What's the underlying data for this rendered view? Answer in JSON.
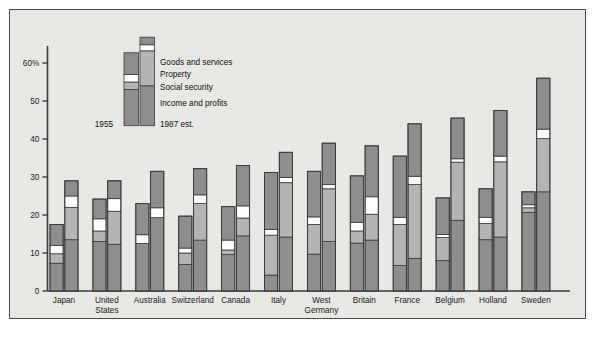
{
  "chart_data": {
    "type": "bar",
    "subtype": "grouped-stacked",
    "title": "",
    "xlabel": "",
    "ylabel": "",
    "ylim": [
      0,
      65
    ],
    "ytick_values": [
      0,
      10,
      20,
      30,
      40,
      50,
      60
    ],
    "ytick_labels": [
      "0",
      "10",
      "20",
      "30",
      "40",
      "50",
      "60%"
    ],
    "grid": false,
    "legend_position": "inside-upper-left",
    "series_order": [
      "Income and profits",
      "Social security",
      "Property",
      "Goods and services"
    ],
    "series_colors": [
      "#8e8e8e",
      "#b4b4b4",
      "#ffffff",
      "#8e8e8e"
    ],
    "group_labels": [
      "1955",
      "1987 est."
    ],
    "categories": [
      "Japan",
      "United States",
      "Australia",
      "Switzerland",
      "Canada",
      "Italy",
      "West Germany",
      "Britain",
      "France",
      "Belgium",
      "Holland",
      "Sweden"
    ],
    "category_label_lines": [
      [
        "Japan"
      ],
      [
        "United",
        "States"
      ],
      [
        "Australia"
      ],
      [
        "Switzerland"
      ],
      [
        "Canada"
      ],
      [
        "Italy"
      ],
      [
        "West",
        "Germany"
      ],
      [
        "Britain"
      ],
      [
        "France"
      ],
      [
        "Belgium"
      ],
      [
        "Holland"
      ],
      [
        "Sweden"
      ]
    ],
    "data": [
      {
        "category": "Japan",
        "1955": {
          "income_and_profits": 7.3,
          "social_security": 2.5,
          "property": 2.2,
          "goods_and_services": 5.5,
          "total": 17.5
        },
        "1987": {
          "income_and_profits": 13.5,
          "social_security": 8.5,
          "property": 3.0,
          "goods_and_services": 4.0,
          "total": 29.0
        }
      },
      {
        "category": "United States",
        "1955": {
          "income_and_profits": 13.0,
          "social_security": 2.8,
          "property": 3.2,
          "goods_and_services": 5.2,
          "total": 24.2
        },
        "1987": {
          "income_and_profits": 12.3,
          "social_security": 8.7,
          "property": 3.3,
          "goods_and_services": 4.7,
          "total": 29.0
        }
      },
      {
        "category": "Australia",
        "1955": {
          "income_and_profits": 12.5,
          "social_security": 0.0,
          "property": 2.3,
          "goods_and_services": 8.2,
          "total": 23.0
        },
        "1987": {
          "income_and_profits": 19.3,
          "social_security": 0.0,
          "property": 2.6,
          "goods_and_services": 9.6,
          "total": 31.5
        }
      },
      {
        "category": "Switzerland",
        "1955": {
          "income_and_profits": 7.0,
          "social_security": 3.0,
          "property": 1.3,
          "goods_and_services": 8.4,
          "total": 19.7
        },
        "1987": {
          "income_and_profits": 13.4,
          "social_security": 9.6,
          "property": 2.3,
          "goods_and_services": 6.9,
          "total": 32.2
        }
      },
      {
        "category": "Canada",
        "1955": {
          "income_and_profits": 9.6,
          "social_security": 1.2,
          "property": 2.6,
          "goods_and_services": 8.8,
          "total": 22.2
        },
        "1987": {
          "income_and_profits": 14.5,
          "social_security": 4.7,
          "property": 3.2,
          "goods_and_services": 10.6,
          "total": 33.0
        }
      },
      {
        "category": "Italy",
        "1955": {
          "income_and_profits": 4.2,
          "social_security": 10.5,
          "property": 1.5,
          "goods_and_services": 15.0,
          "total": 31.2
        },
        "1987": {
          "income_and_profits": 14.2,
          "social_security": 14.3,
          "property": 1.4,
          "goods_and_services": 6.6,
          "total": 36.5
        }
      },
      {
        "category": "West Germany",
        "1955": {
          "income_and_profits": 9.7,
          "social_security": 7.8,
          "property": 2.0,
          "goods_and_services": 12.0,
          "total": 31.5
        },
        "1987": {
          "income_and_profits": 13.0,
          "social_security": 13.9,
          "property": 1.1,
          "goods_and_services": 10.9,
          "total": 38.9
        }
      },
      {
        "category": "Britain",
        "1955": {
          "income_and_profits": 12.6,
          "social_security": 3.2,
          "property": 2.3,
          "goods_and_services": 12.2,
          "total": 30.3
        },
        "1987": {
          "income_and_profits": 13.4,
          "social_security": 6.8,
          "property": 4.6,
          "goods_and_services": 13.4,
          "total": 38.2
        }
      },
      {
        "category": "France",
        "1955": {
          "income_and_profits": 6.7,
          "social_security": 10.8,
          "property": 1.9,
          "goods_and_services": 16.1,
          "total": 35.5
        },
        "1987": {
          "income_and_profits": 8.6,
          "social_security": 19.4,
          "property": 2.2,
          "goods_and_services": 13.8,
          "total": 44.0
        }
      },
      {
        "category": "Belgium",
        "1955": {
          "income_and_profits": 8.0,
          "social_security": 6.1,
          "property": 0.8,
          "goods_and_services": 9.6,
          "total": 24.5
        },
        "1987": {
          "income_and_profits": 18.6,
          "social_security": 15.3,
          "property": 0.9,
          "goods_and_services": 10.7,
          "total": 45.5
        }
      },
      {
        "category": "Holland",
        "1955": {
          "income_and_profits": 13.5,
          "social_security": 4.3,
          "property": 1.6,
          "goods_and_services": 7.5,
          "total": 26.9
        },
        "1987": {
          "income_and_profits": 14.2,
          "social_security": 19.8,
          "property": 1.5,
          "goods_and_services": 12.0,
          "total": 47.5
        }
      },
      {
        "category": "Sweden",
        "1955": {
          "income_and_profits": 20.7,
          "social_security": 1.2,
          "property": 0.8,
          "goods_and_services": 3.4,
          "total": 26.1
        },
        "1987": {
          "income_and_profits": 26.1,
          "social_security": 14.0,
          "property": 2.5,
          "goods_and_services": 13.4,
          "total": 56.0
        }
      }
    ]
  },
  "legend": {
    "items": [
      {
        "label": "Goods and services"
      },
      {
        "label": "Property"
      },
      {
        "label": "Social security"
      },
      {
        "label": "Income and profits"
      }
    ],
    "left_year": "1955",
    "right_year": "1987 est."
  },
  "colors": {
    "panel_background": "#e8e8e4",
    "frame_border": "#4a4a4a",
    "axis": "#3b3b3b",
    "segment_border": "#3a3a3a",
    "dark_fill": "#8e8e8e",
    "light_fill": "#b4b4b4",
    "white_fill": "#ffffff",
    "text": "#111111"
  }
}
